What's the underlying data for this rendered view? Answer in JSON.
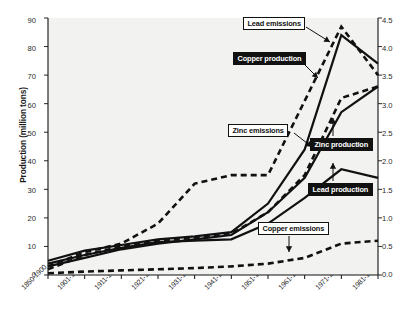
{
  "chart": {
    "type": "line",
    "title": "",
    "ylabel": "Production (million tons)",
    "ylabel_right": "",
    "xlabel": "",
    "grid": false,
    "legend_position": "inline-callouts",
    "ylim": [
      0,
      90
    ],
    "ylim_right": [
      0.0,
      4.5
    ],
    "yticks": [
      "0",
      "10",
      "20",
      "30",
      "40",
      "50",
      "60",
      "70",
      "80",
      "90"
    ],
    "yticks_right": [
      "0.0",
      "0.5",
      "1.0",
      "1.5",
      "2.0",
      "2.5",
      "3.0",
      "3.5",
      "4.0",
      "4.5"
    ],
    "categories": [
      "1850-1900",
      "1901-1910",
      "1911-1920",
      "1921-1930",
      "1931-1940",
      "1941-1950",
      "1951-1960",
      "1961-1970",
      "1971-1980",
      "1981-1990"
    ]
  },
  "chart_data": {
    "type": "line",
    "title": "",
    "xlabel": "",
    "ylabel": "Production (million tons)",
    "ylabel_right": "",
    "ylim": [
      0,
      90
    ],
    "ylim_right": [
      0.0,
      4.5
    ],
    "grid": false,
    "legend_position": "inline-callouts",
    "categories": [
      "1850-1900",
      "1901-1910",
      "1911-1920",
      "1921-1930",
      "1931-1940",
      "1941-1950",
      "1951-1960",
      "1961-1970",
      "1971-1980",
      "1981-1990"
    ],
    "series": [
      {
        "name": "Copper production",
        "axis": "left",
        "style": "solid",
        "values": [
          5.0,
          8.5,
          10.5,
          12.5,
          13.5,
          15.0,
          25.0,
          44.0,
          84.0,
          74.0
        ]
      },
      {
        "name": "Zinc production",
        "axis": "left",
        "style": "solid",
        "values": [
          3.0,
          6.0,
          9.0,
          11.0,
          12.5,
          14.0,
          22.0,
          34.0,
          57.0,
          66.0
        ]
      },
      {
        "name": "Lead production",
        "axis": "left",
        "style": "solid",
        "values": [
          4.0,
          7.0,
          9.5,
          11.5,
          12.0,
          12.5,
          18.0,
          27.0,
          37.0,
          34.0
        ]
      },
      {
        "name": "Lead emissions",
        "axis": "right",
        "style": "dashed",
        "values": [
          0.15,
          0.4,
          0.55,
          0.9,
          1.6,
          1.75,
          1.75,
          3.05,
          4.35,
          3.5
        ]
      },
      {
        "name": "Zinc emissions",
        "axis": "right",
        "style": "dashed",
        "values": [
          0.1,
          0.35,
          0.5,
          0.6,
          0.65,
          0.72,
          1.1,
          1.75,
          3.1,
          3.3
        ]
      },
      {
        "name": "Copper emissions",
        "axis": "right",
        "style": "dashed",
        "values": [
          0.03,
          0.06,
          0.08,
          0.1,
          0.12,
          0.15,
          0.2,
          0.3,
          0.55,
          0.6
        ]
      }
    ],
    "annotations": [
      {
        "label": "Lead emissions",
        "style": "light-box"
      },
      {
        "label": "Copper production",
        "style": "dark-box"
      },
      {
        "label": "Zinc emissions",
        "style": "light-box"
      },
      {
        "label": "Zinc production",
        "style": "dark-box"
      },
      {
        "label": "Lead production",
        "style": "dark-box"
      },
      {
        "label": "Copper emissions",
        "style": "light-box"
      }
    ]
  },
  "colors": {
    "ink": "#111111",
    "plot_bg": "#f2f2f0",
    "page_bg": "#ffffff"
  }
}
